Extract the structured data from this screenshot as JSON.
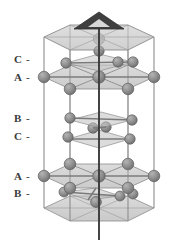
{
  "figure": {
    "name": "close-packed-stacking-unit-cell",
    "background_color": "#ffffff"
  },
  "axis": {
    "name": "c-axis",
    "arrow_glyph": "arrowhead-triangle",
    "line_color": "#3c3c3c",
    "top_y": 14,
    "bottom_y": 240
  },
  "cell": {
    "shape": "hexagonal-prism",
    "edge_color": "#8a8a8a",
    "face_fill": "#b8b8b8",
    "face_opacity": 0.55
  },
  "atoms": {
    "color": "#8c8c8c",
    "edge_color": "#5e5e5e",
    "highlight_color": "#a8a8a8",
    "radius_large": 6.2,
    "radius_small": 5.2
  },
  "labels": [
    {
      "id": "label-c-top",
      "letter": "C",
      "dash": "-",
      "y": 60,
      "layer": "C"
    },
    {
      "id": "label-a-upper",
      "letter": "A",
      "dash": "-",
      "y": 78,
      "layer": "A"
    },
    {
      "id": "label-b-middle",
      "letter": "B",
      "dash": "-",
      "y": 119,
      "layer": "B"
    },
    {
      "id": "label-c-middle",
      "letter": "C",
      "dash": "-",
      "y": 137,
      "layer": "C"
    },
    {
      "id": "label-a-lower",
      "letter": "A",
      "dash": "-",
      "y": 177,
      "layer": "A"
    },
    {
      "id": "label-b-bottom",
      "letter": "B",
      "dash": "-",
      "y": 194,
      "layer": "B"
    }
  ],
  "stacking_sequence": [
    "C",
    "A",
    "B",
    "C",
    "A",
    "B"
  ],
  "label_x": 14
}
